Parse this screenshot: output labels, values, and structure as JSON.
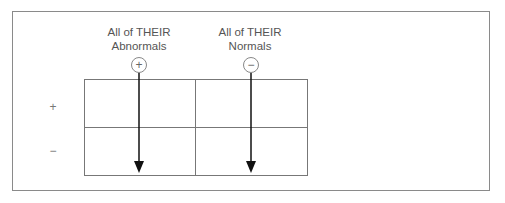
{
  "diagram": {
    "columns": [
      {
        "header_line1": "All of THEIR",
        "header_line2": "Abnormals",
        "sign": "+"
      },
      {
        "header_line1": "All of THEIR",
        "header_line2": "Normals",
        "sign": "−"
      }
    ],
    "rows": [
      {
        "label": "+"
      },
      {
        "label": "−"
      }
    ],
    "arrows": [
      {
        "column": 0,
        "direction": "down"
      },
      {
        "column": 1,
        "direction": "down"
      }
    ],
    "colors": {
      "border": "#777777",
      "text": "#555555",
      "arrow": "#111111"
    }
  }
}
